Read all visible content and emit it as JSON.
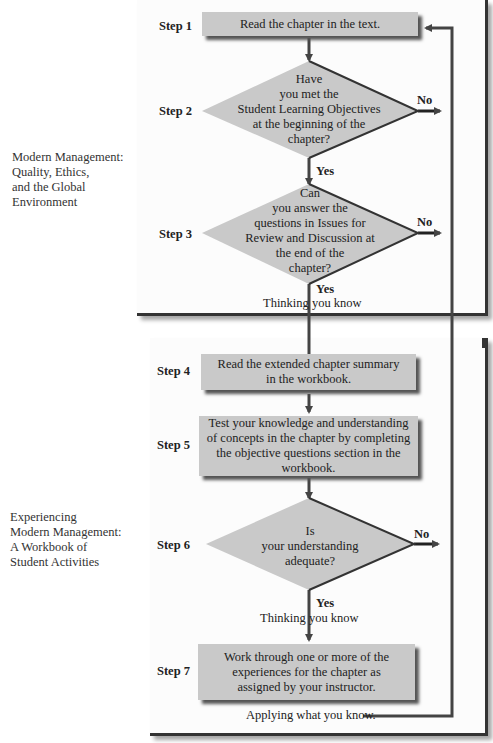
{
  "panels": [
    {
      "side_label": [
        "Modern Management:",
        "Quality, Ethics,",
        "and the Global",
        "Environment"
      ]
    },
    {
      "side_label": [
        "Experiencing",
        "Modern Management:",
        "A Workbook of",
        "Student Activities"
      ]
    }
  ],
  "steps": [
    {
      "label": "Step 1",
      "type": "process",
      "text": [
        "Read the chapter in the text."
      ]
    },
    {
      "label": "Step 2",
      "type": "decision",
      "text": [
        "Have",
        "you met the",
        "Student Learning Objectives",
        "at the beginning of the",
        "chapter?"
      ],
      "yes": "Yes",
      "no": "No"
    },
    {
      "label": "Step 3",
      "type": "decision",
      "text": [
        "Can",
        "you answer the",
        "questions in Issues for",
        "Review and Discussion at",
        "the end of the",
        "chapter?"
      ],
      "yes": "Yes",
      "no": "No",
      "caption": "Thinking you know"
    },
    {
      "label": "Step 4",
      "type": "process",
      "text": [
        "Read the extended chapter summary",
        "in the workbook."
      ]
    },
    {
      "label": "Step 5",
      "type": "process",
      "text": [
        "Test your knowledge and understanding",
        "of concepts in the chapter by completing",
        "the objective questions section in the",
        "workbook."
      ]
    },
    {
      "label": "Step 6",
      "type": "decision",
      "text": [
        "Is",
        "your understanding",
        "adequate?"
      ],
      "yes": "Yes",
      "no": "No",
      "caption": "Thinking you know"
    },
    {
      "label": "Step 7",
      "type": "process",
      "text": [
        "Work through one or more of the",
        "experiences for the chapter as",
        "assigned by your instructor."
      ],
      "caption": "Applying what you know."
    }
  ],
  "colors": {
    "box_fill": "#c9c9c9",
    "line": "#444444",
    "panel_bg": "#fcfcfc"
  }
}
